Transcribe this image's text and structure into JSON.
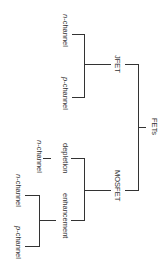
{
  "diagram": {
    "orientation": "rotated-90-clockwise",
    "root": {
      "label": "FETs",
      "children": [
        {
          "label": "JFET",
          "children": [
            {
              "prefix": "n",
              "suffix": "-channel"
            },
            {
              "prefix": "p",
              "suffix": "-channel"
            }
          ]
        },
        {
          "label": "MOSFET",
          "children": [
            {
              "label": "depletion",
              "children": [
                {
                  "prefix": "n",
                  "suffix": "-channel"
                }
              ]
            },
            {
              "label": "enhancement",
              "children": [
                {
                  "prefix": "n",
                  "suffix": "-channel"
                },
                {
                  "prefix": "p",
                  "suffix": "-channel"
                }
              ]
            }
          ]
        }
      ]
    },
    "colors": {
      "line": "#333333",
      "text": "#333333",
      "background": "#ffffff"
    }
  }
}
